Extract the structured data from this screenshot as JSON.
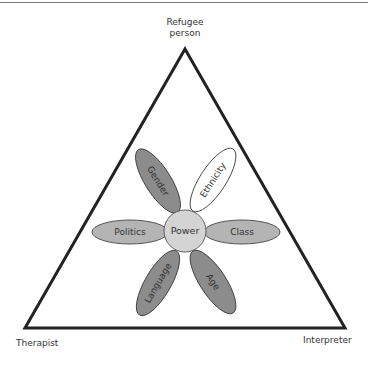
{
  "diagram": {
    "vertices": {
      "apex": "Refugee person",
      "apex_line1": "Refugee",
      "apex_line2": "person",
      "bottom_left": "Therapist",
      "bottom_right": "Interpreter"
    },
    "center": "Power",
    "petals": [
      {
        "label": "Gender",
        "fill": "#8c8c8c"
      },
      {
        "label": "Ethnicity",
        "fill": "#ffffff"
      },
      {
        "label": "Politics",
        "fill": "#b4b4b4"
      },
      {
        "label": "Class",
        "fill": "#b4b4b4"
      },
      {
        "label": "Language",
        "fill": "#8c8c8c"
      },
      {
        "label": "Age",
        "fill": "#8c8c8c"
      }
    ],
    "colors": {
      "outline": "#333333",
      "center_fill": "#d4d4d4",
      "triangle_stroke": "#222222"
    }
  }
}
